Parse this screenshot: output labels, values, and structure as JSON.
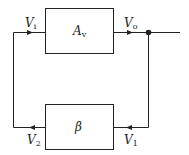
{
  "diagram": {
    "type": "feedback-block-diagram",
    "forward_block": {
      "label": "A",
      "subscript": "v"
    },
    "feedback_block": {
      "label": "β"
    },
    "signals": {
      "input": {
        "label": "V",
        "subscript": "i"
      },
      "output": {
        "label": "V",
        "subscript": "o"
      },
      "feedback_in": {
        "label": "V",
        "subscript": "1"
      },
      "feedback_out": {
        "label": "V",
        "subscript": "2"
      }
    },
    "colors": {
      "stroke": "#222222",
      "background": "#ffffff"
    }
  }
}
